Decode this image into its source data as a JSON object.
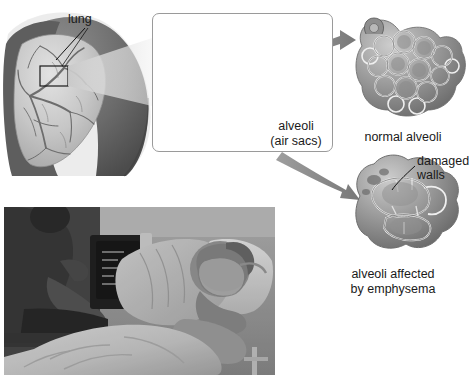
{
  "figure": {
    "type": "medical-illustration",
    "background_color": "#ffffff",
    "ink_color": "#1a1a1a"
  },
  "labels": {
    "lung": "lung",
    "alveoli": "alveoli",
    "air_sacs": "(air sacs)",
    "normal_alveoli": "normal alveoli",
    "damaged": "damaged",
    "walls": "walls",
    "affected_line1": "alveoli affected",
    "affected_line2": "by emphysema"
  },
  "panels": [
    {
      "name": "torso-lung",
      "description": "Grayscale torso with cutaway lung showing bronchial tree and a highlight rectangle",
      "label": "lung"
    },
    {
      "name": "bronchiole-alveoli-panel",
      "description": "Boxed magnified view of bronchiole with grape-like alveoli clusters",
      "label": "alveoli (air sacs)",
      "border_color": "#9a9a9a"
    },
    {
      "name": "normal-alveoli-panel",
      "description": "Cluster of intact rounded alveoli with many thin walls",
      "caption": "normal alveoli"
    },
    {
      "name": "emphysema-alveoli-panel",
      "description": "Enlarged merged air spaces with broken septa",
      "caption": "alveoli affected by emphysema",
      "callout": "damaged walls"
    },
    {
      "name": "patient-photograph",
      "description": "Black and white photo of an elderly patient reclining in a hospital bed wearing an oxygen mask, with a caregiver and monitor at left",
      "caption": ""
    }
  ],
  "arrows": [
    {
      "name": "arrow-to-normal",
      "from": "bronchiole-alveoli-panel",
      "to": "normal-alveoli-panel",
      "color": "#8c8c8c"
    },
    {
      "name": "arrow-to-emphysema",
      "from": "bronchiole-alveoli-panel",
      "to": "emphysema-alveoli-panel",
      "color": "#8c8c8c"
    }
  ],
  "colors": {
    "arrow_gray": "#8c8c8c",
    "panel_border": "#9a9a9a",
    "leader_line": "#111111",
    "skin_dark": "#585858",
    "skin_mid": "#7d7d7d",
    "lung_light": "#cfcfcf",
    "alveoli_mid": "#9d9d9d"
  }
}
